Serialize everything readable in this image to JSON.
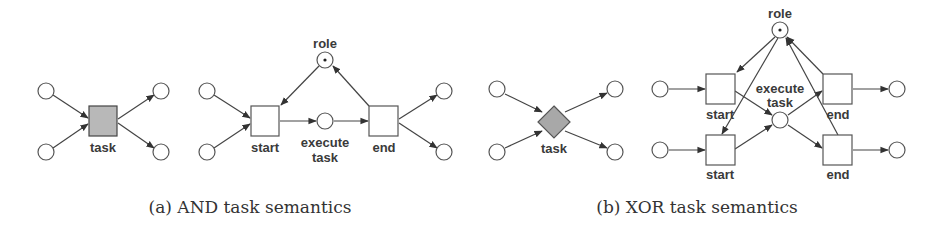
{
  "figure": {
    "subfigures": [
      {
        "id": "a",
        "caption": "(a) AND task semantics",
        "compact": {
          "task_label": "task",
          "task_shape": "square",
          "task_fill": "#b8b8b8"
        },
        "expanded": {
          "role_label": "role",
          "start_label": "start",
          "execute_label_line1": "execute",
          "execute_label_line2": "task",
          "end_label": "end"
        }
      },
      {
        "id": "b",
        "caption": "(b) XOR task semantics",
        "compact": {
          "task_label": "task",
          "task_shape": "diamond",
          "task_fill": "#a8a8a8"
        },
        "expanded": {
          "role_label": "role",
          "start_label_top": "start",
          "start_label_bottom": "start",
          "execute_label_line1": "execute",
          "execute_label_line2": "task",
          "end_label_top": "end",
          "end_label_bottom": "end"
        }
      }
    ]
  }
}
